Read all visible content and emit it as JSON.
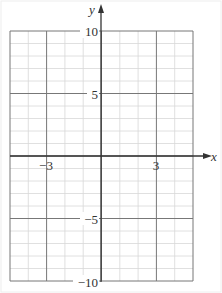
{
  "chart_data": {
    "type": "line",
    "title": "",
    "xlabel": "x",
    "ylabel": "y",
    "xlim": [
      -5,
      5
    ],
    "ylim": [
      -10,
      10
    ],
    "grid": true,
    "x_ticks_labeled": [
      "-3",
      "3"
    ],
    "y_ticks_labeled": [
      "10",
      "5",
      "-5",
      "-10"
    ],
    "x_grid_step": 1,
    "y_grid_step": 1,
    "major_x_lines": [
      -5,
      -3,
      0,
      3,
      5
    ],
    "major_y_lines": [
      -10,
      -5,
      0,
      5,
      10
    ],
    "series": []
  },
  "labels": {
    "x_axis": "x",
    "y_axis": "y",
    "x_neg3": "−3",
    "x_pos3": "3",
    "y_10": "10",
    "y_5": "5",
    "y_neg5": "−5",
    "y_neg10": "−10"
  },
  "colors": {
    "minor_grid": "#d8d8d8",
    "major_grid": "#777777",
    "axis": "#333333"
  }
}
